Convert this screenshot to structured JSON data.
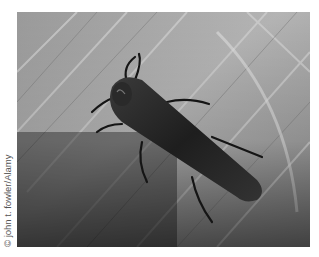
{
  "photo": {
    "subject": "beetle on leaf",
    "style": "grayscale photograph",
    "credit": "© john t. fowler/Alamy"
  }
}
